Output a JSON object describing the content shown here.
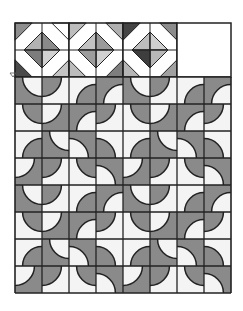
{
  "image": {
    "title": "Drunkard's Path quilt pattern with diamond header",
    "width": 243,
    "height": 311
  },
  "colors": {
    "background": "#ffffff",
    "outline": "#222222",
    "curve_gray": "#8a8a8a",
    "curve_light": "#f4f4f4",
    "band_white": "#ffffff"
  },
  "grid": {
    "left": 15,
    "top": 23,
    "cell": 27,
    "columns": 8,
    "curve_rows": 8,
    "curve_top": 77,
    "header_rows": 2,
    "header_block_count": 3,
    "header_empty_block": {
      "x": 177,
      "y": 23,
      "w": 54,
      "h": 54
    }
  },
  "curve_tile": [
    [
      {
        "bg": "gray",
        "corner": "TR"
      },
      {
        "bg": "white",
        "corner": "TL"
      },
      {
        "bg": "white",
        "corner": "BR"
      },
      {
        "bg": "gray",
        "corner": "BR"
      }
    ],
    [
      {
        "bg": "white",
        "corner": "TR"
      },
      {
        "bg": "gray",
        "corner": "TL"
      },
      {
        "bg": "gray",
        "corner": "BR"
      },
      {
        "bg": "white",
        "corner": "TL"
      }
    ],
    [
      {
        "bg": "white",
        "corner": "BR"
      },
      {
        "bg": "gray",
        "corner": "TR"
      },
      {
        "bg": "gray",
        "corner": "BL"
      },
      {
        "bg": "white",
        "corner": "BL"
      }
    ],
    [
      {
        "bg": "gray",
        "corner": "TL"
      },
      {
        "bg": "white",
        "corner": "TL"
      },
      {
        "bg": "white",
        "corner": "TR"
      },
      {
        "bg": "gray",
        "corner": "BL"
      }
    ]
  ],
  "diamond_blocks": [
    {
      "corners": {
        "TL": "#8e8e8e",
        "TR": "#ffffff",
        "BL": "#4a4a4a",
        "BR": "#c4c4c4"
      },
      "diamond": {
        "T": "#b2b2b2",
        "R": "#8a8a8a",
        "B": "#d2d2d2",
        "L": "#7c7c7c"
      },
      "top_right_corner_detail": "#6a6a6a"
    },
    {
      "corners": {
        "TL": "#bdbdbd",
        "TR": "#b0b0b0",
        "BL": "#bcbcbc",
        "BR": "#7e7e7e"
      },
      "diamond": {
        "T": "#c2c2c2",
        "R": "#9a9a9a",
        "B": "#d0d0d0",
        "L": "#9c9c9c"
      },
      "top_right_corner_detail": "#ffffff"
    },
    {
      "corners": {
        "TL": "#444444",
        "TR": "#8c8c8c",
        "BL": "#b5b5b5",
        "BR": "#a0a0a0"
      },
      "diamond": {
        "T": "#bdbdbd",
        "R": "#cfcfcf",
        "B": "#b8b8b8",
        "L": "#3e3e3e"
      },
      "top_right_corner_detail": "#ffffff"
    }
  ],
  "stray_mark": {
    "shape": "small-triangle-outline",
    "x": 10,
    "y": 73
  }
}
